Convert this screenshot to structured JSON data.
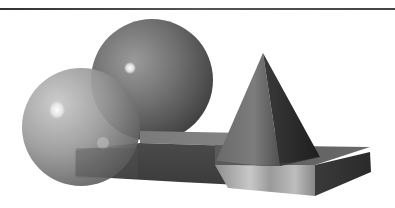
{
  "figure": {
    "objects": [
      {
        "type": "sphere",
        "label": "back-sphere"
      },
      {
        "type": "sphere",
        "label": "front-translucent-sphere"
      },
      {
        "type": "cone",
        "label": "cone"
      },
      {
        "type": "slab",
        "label": "dark-slab"
      },
      {
        "type": "slab",
        "label": "marble-slab"
      }
    ],
    "colors": {
      "background": "#ffffff",
      "rule": "#444444"
    }
  }
}
